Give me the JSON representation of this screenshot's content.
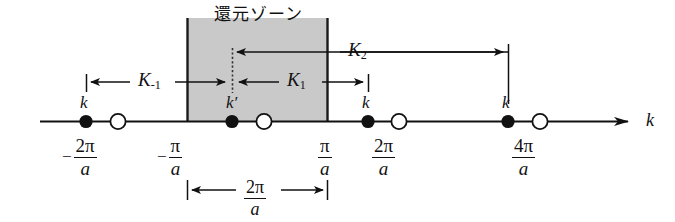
{
  "figure": {
    "type": "reciprocal-space-diagram",
    "zone": {
      "title": "還元ゾーン",
      "fill_color": "#c9c9c9",
      "border_color": "#1a1a1a",
      "left_boundary_label": "-π/a",
      "right_boundary_label": "π/a",
      "width_label": {
        "numerator": "2π",
        "denominator": "a"
      }
    },
    "axis": {
      "name": "k",
      "line_color": "#111111",
      "arrow": "right-arrow-icon"
    },
    "tick_labels": [
      {
        "id": "tick-neg-2pi-a",
        "sign": "−",
        "numerator": "2π",
        "denominator": "a"
      },
      {
        "id": "tick-neg-pi-a",
        "sign": "−",
        "numerator": "π",
        "denominator": "a"
      },
      {
        "id": "tick-pos-pi-a",
        "sign": "",
        "numerator": "π",
        "denominator": "a"
      },
      {
        "id": "tick-pos-2pi-a",
        "sign": "",
        "numerator": "2π",
        "denominator": "a"
      },
      {
        "id": "tick-pos-4pi-a",
        "sign": "",
        "numerator": "4π",
        "denominator": "a"
      }
    ],
    "points": [
      {
        "id": "k-point-1",
        "kind": "filled",
        "label": "k",
        "prime": false
      },
      {
        "id": "open-point-1",
        "kind": "open",
        "label": "",
        "prime": false
      },
      {
        "id": "k-point-prime",
        "kind": "filled",
        "label": "k",
        "prime": true
      },
      {
        "id": "open-point-2",
        "kind": "open",
        "label": "",
        "prime": false
      },
      {
        "id": "k-point-2",
        "kind": "filled",
        "label": "k",
        "prime": false
      },
      {
        "id": "open-point-3",
        "kind": "open",
        "label": "",
        "prime": false
      },
      {
        "id": "k-point-3",
        "kind": "filled",
        "label": "k",
        "prime": false
      },
      {
        "id": "open-point-4",
        "kind": "open",
        "label": "",
        "prime": false
      }
    ],
    "vectors": [
      {
        "id": "vector-K-minus-1",
        "symbol": "K",
        "subscript": "-1",
        "direction": "left"
      },
      {
        "id": "vector-K-1",
        "symbol": "K",
        "subscript": "1",
        "direction": "right"
      },
      {
        "id": "vector-K-2",
        "symbol": "K",
        "subscript": "2",
        "direction": "right"
      }
    ]
  }
}
